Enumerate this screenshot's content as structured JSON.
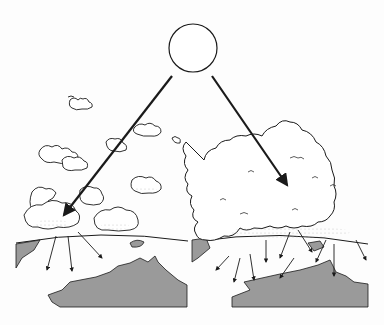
{
  "figure": {
    "colors": {
      "background": "#fdfdfd",
      "ink": "#1a1a1a",
      "land": "#9a9a9a",
      "cloud_fill": "#ffffff"
    },
    "panels": [
      {
        "name": "scattered-clouds",
        "ray_count": 3
      },
      {
        "name": "dense-clouds",
        "ray_count": 9
      }
    ]
  }
}
